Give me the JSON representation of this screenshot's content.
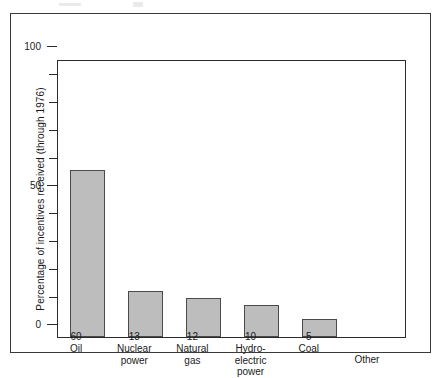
{
  "figure": {
    "border_color": "#3a3a3a",
    "background": "#ffffff"
  },
  "chart_data": {
    "type": "bar",
    "title": "",
    "subtitle": "",
    "xlabel": "",
    "ylabel": "Percentage of incentives received (through 1976)",
    "categories": [
      "Oil",
      "Nuclear power",
      "Natural gas",
      "Hydro-electric power",
      "Coal",
      "Other"
    ],
    "category_lines": [
      [
        "Oil"
      ],
      [
        "Nuclear",
        "power"
      ],
      [
        "Natural",
        "gas"
      ],
      [
        "Hydro-",
        "electric",
        "power"
      ],
      [
        "Coal"
      ],
      [
        "Other"
      ]
    ],
    "data_labels": [
      "60",
      "13",
      "12",
      "10",
      "5",
      ""
    ],
    "values": [
      60,
      16.5,
      14,
      11.5,
      6.5,
      0
    ],
    "ylim": [
      0,
      100
    ],
    "ytick_labels": [
      "0",
      "50",
      "100"
    ],
    "ytick_values": [
      0,
      50,
      100
    ],
    "minor_ticks": [
      10,
      20,
      30,
      40,
      60,
      70,
      80,
      90
    ],
    "grid": false,
    "legend": false,
    "bar_color": "#bdbdbd",
    "bar_edge_color": "#4a4a4a",
    "axis_color": "#2b2b2b"
  }
}
